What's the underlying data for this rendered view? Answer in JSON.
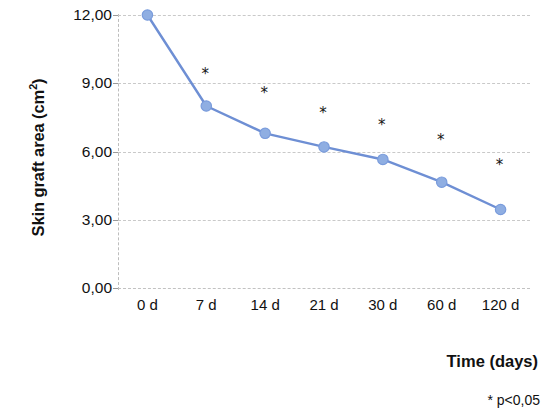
{
  "chart_data": {
    "type": "line",
    "title": "",
    "xlabel": "Time (days)",
    "ylabel": "Skin graft area (cm²)",
    "ylabel_text": "Skin graft area (cm",
    "ylabel_sup": "2",
    "ylabel_tail": ")",
    "categories": [
      "0 d",
      "7 d",
      "14 d",
      "21 d",
      "30 d",
      "60 d",
      "120 d"
    ],
    "values": [
      12.0,
      8.0,
      6.8,
      6.2,
      5.65,
      4.65,
      3.45
    ],
    "series": [
      {
        "name": "Skin graft area",
        "values": [
          12.0,
          8.0,
          6.8,
          6.2,
          5.65,
          4.65,
          3.45
        ]
      }
    ],
    "ylim": [
      0,
      12
    ],
    "yticks": [
      0,
      3,
      6,
      9,
      12
    ],
    "ytick_labels": [
      "0,00",
      "3,00",
      "6,00",
      "9,00",
      "12,00"
    ],
    "grid": true,
    "grid_axis": "y",
    "legend": "none",
    "annotations": [
      {
        "label": "*",
        "category": "7 d",
        "value": 9.4
      },
      {
        "label": "*",
        "category": "14 d",
        "value": 8.55
      },
      {
        "label": "*",
        "category": "21 d",
        "value": 7.7
      },
      {
        "label": "*",
        "category": "30 d",
        "value": 7.15
      },
      {
        "label": "*",
        "category": "60 d",
        "value": 6.5
      },
      {
        "label": "*",
        "category": "120 d",
        "value": 5.4
      }
    ],
    "footnote": "* p<0,05",
    "colors": {
      "line": "#6E8FD4",
      "marker": "#8FAEE2",
      "marker_edge": "#7A9CDC",
      "grid": "#c9c9c9",
      "text": "#111111",
      "background": "#ffffff"
    }
  },
  "footnote": {
    "text": "* p<0,05"
  }
}
